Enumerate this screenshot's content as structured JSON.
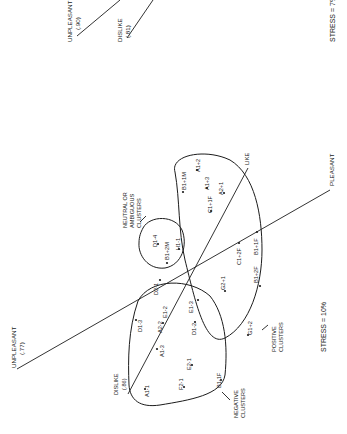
{
  "figure": {
    "orientation": "rotated 90 degrees counter-clockwise (text reads bottom-to-top)",
    "top_panel": {
      "axis_labels": [
        {
          "id": "unpleasant_top",
          "text": "UNPLEASANT",
          "value": "(.90)"
        },
        {
          "id": "dislike_top",
          "text": "DISLIKE",
          "value": "(.81)"
        }
      ],
      "stress": "STRESS = 7%"
    },
    "main_panel": {
      "axis_labels": {
        "unpleasant": {
          "text": "UNPLEASANT",
          "value": "(.77)"
        },
        "pleasant": {
          "text": "PLEASANT"
        },
        "dislike": {
          "text": "DISLIKE",
          "value": "(.86)"
        },
        "like": {
          "text": "LIKE"
        }
      },
      "cluster_labels": {
        "neutral": [
          "NEUTRAL OR",
          "AMBIGUOUS",
          "CLUSTERS"
        ],
        "positive": [
          "POSITIVE",
          "CLUSTERS"
        ],
        "negative": [
          "NEGATIVE",
          "CLUSTERS"
        ]
      },
      "stress": "STRESS = 10%",
      "points": {
        "positive": [
          "A1+2",
          "A1+3",
          "A2+1",
          "B1+1M",
          "C1+1F",
          "C1+2F",
          "B1+1F",
          "B1+2F",
          "G2+1",
          "G1+2"
        ],
        "neutral": [
          "D1-4",
          "B1+2M",
          "H1-1"
        ],
        "negative": [
          "D2-1",
          "D1-3",
          "A2-2",
          "E1-2",
          "E1-3",
          "A1-3",
          "D1-2",
          "E2-1",
          "F2-1",
          "A1-1",
          "B1-1F"
        ]
      }
    }
  }
}
